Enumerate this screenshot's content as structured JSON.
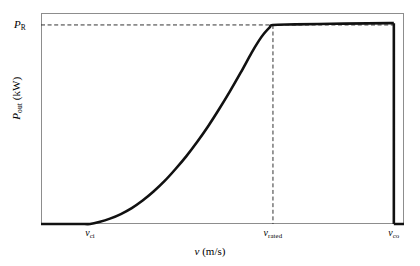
{
  "figure": {
    "background_color": "#ffffff",
    "frame_color": "#8d8d8d",
    "curve_color": "#111111",
    "dash_color": "#333333"
  },
  "axes": {
    "y": {
      "label_symbol": "P",
      "label_subscript": "out",
      "label_unit": "(kW)",
      "label_full": "P_out (kW)",
      "ticks": [
        {
          "symbol": "P",
          "subscript": "R",
          "text": "P_R",
          "value": 1.0
        }
      ]
    },
    "x": {
      "label_symbol": "v",
      "label_unit": "(m/s)",
      "label_full": "v (m/s)",
      "ticks": [
        {
          "symbol": "v",
          "subscript": "ci",
          "text": "v_ci"
        },
        {
          "symbol": "v",
          "subscript": "rated",
          "text": "v_rated"
        },
        {
          "symbol": "v",
          "subscript": "co",
          "text": "v_co"
        }
      ]
    }
  },
  "chart_data": {
    "type": "line",
    "title": "",
    "subtitle": "",
    "xlabel": "v (m/s)",
    "ylabel": "P_out (kW)",
    "grid": false,
    "legend": null,
    "xlim": [
      0,
      1
    ],
    "ylim": [
      0,
      1.06
    ],
    "xtick_positions": [
      0.135,
      0.639,
      0.972
    ],
    "xtick_labels": [
      "v_ci",
      "v_rated",
      "v_co"
    ],
    "ytick_positions": [
      1.0
    ],
    "ytick_labels": [
      "P_R"
    ],
    "annotations": [
      {
        "kind": "hline",
        "y": 1.0,
        "x_from": 0.0,
        "x_to": 0.972,
        "style": "dashed",
        "label": "P_R rated power level"
      },
      {
        "kind": "vline",
        "x": 0.639,
        "y_from": 0.0,
        "y_to": 1.0,
        "style": "dashed",
        "label": "v_rated"
      },
      {
        "kind": "vline",
        "x": 0.972,
        "y_from": 0.0,
        "y_to": 1.0,
        "style": "dashed",
        "label": "v_co"
      }
    ],
    "series": [
      {
        "name": "Wind turbine power curve",
        "color": "#111111",
        "x": [
          0.0,
          0.04,
          0.08,
          0.12,
          0.135,
          0.16,
          0.19,
          0.22,
          0.25,
          0.28,
          0.31,
          0.34,
          0.37,
          0.4,
          0.43,
          0.46,
          0.49,
          0.52,
          0.55,
          0.58,
          0.6,
          0.615,
          0.63,
          0.639,
          0.7,
          0.8,
          0.9,
          0.96,
          0.972,
          0.972,
          1.0
        ],
        "y": [
          0.0,
          0.0,
          0.0,
          0.0,
          0.0,
          0.01,
          0.027,
          0.05,
          0.08,
          0.118,
          0.163,
          0.215,
          0.275,
          0.34,
          0.412,
          0.49,
          0.575,
          0.665,
          0.76,
          0.86,
          0.92,
          0.958,
          0.988,
          1.0,
          1.003,
          1.006,
          1.008,
          1.009,
          1.009,
          0.0,
          0.0
        ]
      }
    ],
    "regions": [
      {
        "name": "below-cut-in",
        "x_from": 0.0,
        "x_to": 0.135,
        "description": "zero output"
      },
      {
        "name": "ramp-up",
        "x_from": 0.135,
        "x_to": 0.639,
        "description": "cubic/sigmoid rise to rated power"
      },
      {
        "name": "rated-plateau",
        "x_from": 0.639,
        "x_to": 0.972,
        "description": "constant rated power P_R"
      },
      {
        "name": "above-cut-out",
        "x_from": 0.972,
        "x_to": 1.0,
        "description": "turbine shut down, zero output"
      }
    ]
  }
}
